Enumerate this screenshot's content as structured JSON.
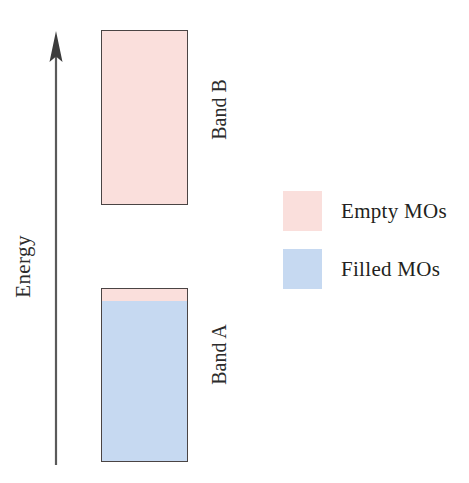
{
  "figure": {
    "background_color": "#ffffff",
    "width": 469,
    "height": 483
  },
  "axis": {
    "label": "Energy",
    "orientation": "vertical",
    "arrow_direction": "up",
    "line_color": "#5a5a5a",
    "name": "energy-axis"
  },
  "colors": {
    "empty_mo": "#fadfdc",
    "filled_mo": "#c6d9f1",
    "outline": "#4a4444",
    "text": "#231f20"
  },
  "bands": [
    {
      "label": "Band B",
      "state": "empty",
      "empty_fraction": 1.0,
      "filled_fraction": 0.0
    },
    {
      "label": "Band A",
      "state": "mostly filled",
      "empty_fraction": 0.07,
      "filled_fraction": 0.93
    }
  ],
  "legend": {
    "items": [
      {
        "label": "Empty MOs",
        "swatch_color": "#fadfdc",
        "swatch_name": "empty-mo-swatch"
      },
      {
        "label": "Filled MOs",
        "swatch_color": "#c6d9f1",
        "swatch_name": "filled-mo-swatch"
      }
    ]
  },
  "chart_data": {
    "type": "bar",
    "title": "",
    "xlabel": "",
    "ylabel": "Energy",
    "grid": false,
    "legend_position": "right",
    "axis_ticks": [],
    "categories": [
      "Band A",
      "Band B"
    ],
    "series": [
      {
        "name": "Filled MOs",
        "values": [
          162,
          0
        ],
        "color": "#c6d9f1"
      },
      {
        "name": "Empty MOs",
        "values": [
          12,
          175
        ],
        "color": "#fadfdc"
      }
    ],
    "annotations": [
      {
        "text": "Band B",
        "target": "Band B",
        "rotation": -90
      },
      {
        "text": "Band A",
        "target": "Band A",
        "rotation": -90
      },
      {
        "text": "Energy",
        "target": "y-axis",
        "rotation": -90
      }
    ]
  }
}
